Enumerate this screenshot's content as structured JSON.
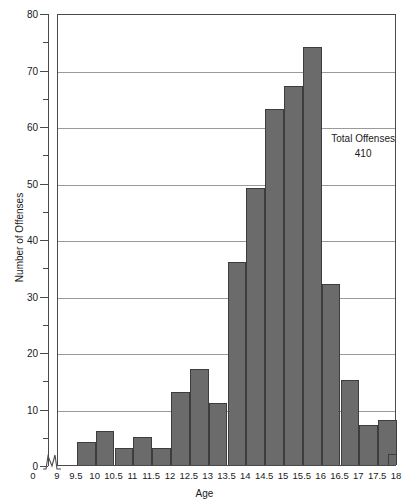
{
  "chart_data": {
    "type": "bar",
    "title": "",
    "xlabel": "Age",
    "ylabel": "Number of Offenses",
    "ylim": [
      0,
      80
    ],
    "xlim": [
      9,
      18
    ],
    "grid": true,
    "bin_width": 0.5,
    "bar_color": "#6b6b6b",
    "y_major_ticks": [
      0,
      10,
      20,
      30,
      40,
      50,
      60,
      70,
      80
    ],
    "y_minor_ticks": [
      5,
      15,
      25,
      35,
      45,
      55,
      65,
      75
    ],
    "x_tick_labels": [
      "9",
      "9.5",
      "10",
      "10.5",
      "11",
      "11.5",
      "12",
      "12.5",
      "13",
      "13.5",
      "14",
      "14.5",
      "15",
      "15.5",
      "16",
      "16.5",
      "17",
      "17.5",
      "18"
    ],
    "bin_starts": [
      9,
      9.5,
      10,
      10.5,
      11,
      11.5,
      12,
      12.5,
      13,
      13.5,
      14,
      14.5,
      15,
      15.5,
      16,
      16.5,
      17,
      17.5
    ],
    "categories": [
      "9–9.5",
      "9.5–10",
      "10–10.5",
      "10.5–11",
      "11–11.5",
      "11.5–12",
      "12–12.5",
      "12.5–13",
      "13–13.5",
      "13.5–14",
      "14–14.5",
      "14.5–15",
      "15–15.5",
      "15.5–16",
      "16–16.5",
      "16.5–17",
      "17–17.5",
      "17.5–18"
    ],
    "values": [
      0,
      4,
      6,
      3,
      5,
      3,
      13,
      17,
      11,
      36,
      49,
      63,
      67,
      74,
      32,
      15,
      7,
      8
    ],
    "tail_value": 2,
    "annotation_label": "Total Offenses",
    "annotation_value": "410",
    "axis_break": true
  }
}
